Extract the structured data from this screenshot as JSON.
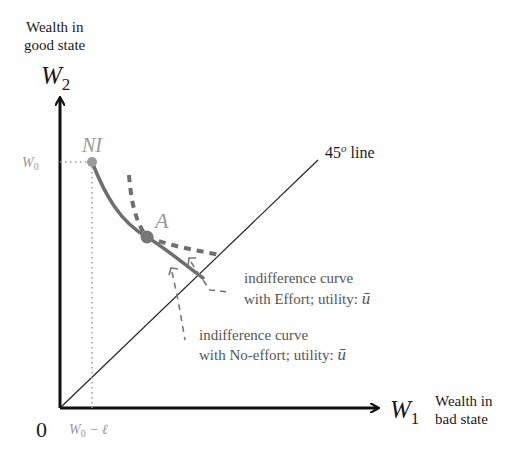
{
  "axes": {
    "y_caption_line1": "Wealth in",
    "y_caption_line2": "good state",
    "y_symbol": "W",
    "y_subscript": "2",
    "x_symbol": "W",
    "x_subscript": "1",
    "x_caption_line1": "Wealth in",
    "x_caption_line2": "bad state",
    "origin_label": "0"
  },
  "ticks": {
    "y_tick": "W",
    "y_tick_sub": "0",
    "x_tick": "W",
    "x_tick_sub": "0",
    "x_tick_rest": " − ℓ"
  },
  "points": {
    "ni_label": "NI",
    "a_label": "A"
  },
  "lines": {
    "diag_label_num": "45",
    "diag_label_sup": "o",
    "diag_label_rest": " line"
  },
  "annotations": {
    "effort_line1": "indifference curve",
    "effort_line2": "with Effort; utility: ",
    "effort_symbol": "ū",
    "noeffort_line1": "indifference curve",
    "noeffort_line2": "with No-effort; utility: ",
    "noeffort_symbol": "ū"
  },
  "colors": {
    "axis": "#111111",
    "curve": "#6e6e6e",
    "dashed": "#6e6e6e",
    "tick_label": "#999999",
    "dot": "#777777",
    "ni_dot": "#999999"
  }
}
